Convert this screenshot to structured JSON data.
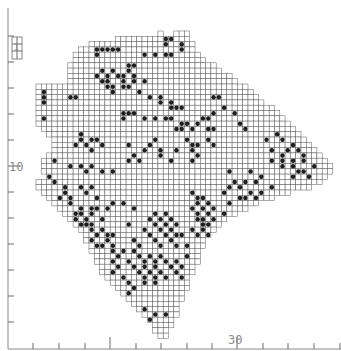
{
  "map": {
    "title": "",
    "axis": {
      "y_label_value": "10",
      "x_label_value": "30",
      "y_ticks_px": [
        36,
        62,
        88,
        114,
        140,
        166,
        192,
        218,
        244,
        270,
        296,
        322
      ],
      "x_ticks_px": [
        33,
        59,
        85,
        110,
        136,
        161,
        187,
        212,
        237,
        263,
        288,
        314,
        340
      ],
      "y_major_tick_px": 166,
      "x_major_tick_px": 237
    },
    "legend_key": "1",
    "grid": {
      "origin_x": 36,
      "origin_y": 31,
      "cell": 5.3,
      "rows": [
        [
          0,
          23,
          23
        ],
        [
          0,
          26,
          28
        ],
        [
          1,
          15,
          28
        ],
        [
          2,
          10,
          29
        ],
        [
          3,
          8,
          29
        ],
        [
          4,
          7,
          30
        ],
        [
          5,
          7,
          31
        ],
        [
          6,
          6,
          33
        ],
        [
          7,
          6,
          34
        ],
        [
          8,
          6,
          36
        ],
        [
          9,
          6,
          37
        ],
        [
          10,
          0,
          39
        ],
        [
          11,
          0,
          40
        ],
        [
          12,
          0,
          41
        ],
        [
          13,
          0,
          42
        ],
        [
          14,
          0,
          44
        ],
        [
          15,
          0,
          45
        ],
        [
          16,
          0,
          46
        ],
        [
          17,
          0,
          47
        ],
        [
          18,
          1,
          48
        ],
        [
          19,
          2,
          49
        ],
        [
          20,
          3,
          50
        ],
        [
          21,
          3,
          51
        ],
        [
          22,
          3,
          52
        ],
        [
          23,
          2,
          53
        ],
        [
          24,
          1,
          54
        ],
        [
          25,
          1,
          55
        ],
        [
          26,
          1,
          55
        ],
        [
          27,
          2,
          54
        ],
        [
          28,
          0,
          53
        ],
        [
          29,
          0,
          51
        ],
        [
          30,
          1,
          47
        ],
        [
          31,
          2,
          44
        ],
        [
          32,
          3,
          41
        ],
        [
          33,
          4,
          39
        ],
        [
          34,
          5,
          37
        ],
        [
          35,
          6,
          35
        ],
        [
          36,
          7,
          34
        ],
        [
          37,
          8,
          33
        ],
        [
          38,
          9,
          32
        ],
        [
          39,
          9,
          31
        ],
        [
          40,
          10,
          31
        ],
        [
          41,
          10,
          30
        ],
        [
          42,
          11,
          30
        ],
        [
          43,
          11,
          30
        ],
        [
          44,
          12,
          29
        ],
        [
          45,
          12,
          29
        ],
        [
          46,
          13,
          28
        ],
        [
          47,
          14,
          28
        ],
        [
          48,
          15,
          28
        ],
        [
          49,
          16,
          27
        ],
        [
          50,
          17,
          27
        ],
        [
          51,
          18,
          26
        ],
        [
          52,
          19,
          26
        ],
        [
          53,
          20,
          26
        ],
        [
          54,
          21,
          25
        ],
        [
          55,
          22,
          25
        ],
        [
          56,
          22,
          24
        ],
        [
          57,
          23,
          24
        ]
      ],
      "filled": [
        [
          1,
          24
        ],
        [
          1,
          25
        ],
        [
          2,
          24
        ],
        [
          2,
          27
        ],
        [
          3,
          27
        ],
        [
          4,
          24
        ],
        [
          4,
          25
        ],
        [
          3,
          11
        ],
        [
          3,
          12
        ],
        [
          3,
          13
        ],
        [
          3,
          14
        ],
        [
          3,
          15
        ],
        [
          4,
          11
        ],
        [
          4,
          20
        ],
        [
          4,
          22
        ],
        [
          6,
          17
        ],
        [
          6,
          18
        ],
        [
          7,
          12
        ],
        [
          7,
          14
        ],
        [
          7,
          17
        ],
        [
          8,
          11
        ],
        [
          8,
          13
        ],
        [
          8,
          15
        ],
        [
          8,
          16
        ],
        [
          8,
          18
        ],
        [
          9,
          12
        ],
        [
          9,
          13
        ],
        [
          9,
          16
        ],
        [
          9,
          18
        ],
        [
          9,
          20
        ],
        [
          10,
          13
        ],
        [
          10,
          14
        ],
        [
          10,
          16
        ],
        [
          10,
          17
        ],
        [
          11,
          14
        ],
        [
          11,
          19
        ],
        [
          11,
          1
        ],
        [
          12,
          1
        ],
        [
          13,
          1
        ],
        [
          12,
          6
        ],
        [
          12,
          7
        ],
        [
          16,
          1
        ],
        [
          12,
          21
        ],
        [
          12,
          23
        ],
        [
          13,
          23
        ],
        [
          13,
          25
        ],
        [
          14,
          25
        ],
        [
          14,
          26
        ],
        [
          14,
          27
        ],
        [
          15,
          16
        ],
        [
          15,
          17
        ],
        [
          15,
          18
        ],
        [
          16,
          16
        ],
        [
          16,
          20
        ],
        [
          16,
          22
        ],
        [
          16,
          24
        ],
        [
          16,
          25
        ],
        [
          17,
          27
        ],
        [
          17,
          28
        ],
        [
          18,
          26
        ],
        [
          18,
          27
        ],
        [
          18,
          29
        ],
        [
          12,
          33
        ],
        [
          12,
          34
        ],
        [
          14,
          35
        ],
        [
          15,
          33
        ],
        [
          15,
          37
        ],
        [
          16,
          31
        ],
        [
          16,
          32
        ],
        [
          17,
          30
        ],
        [
          17,
          38
        ],
        [
          18,
          32
        ],
        [
          18,
          33
        ],
        [
          18,
          39
        ],
        [
          20,
          22
        ],
        [
          20,
          28
        ],
        [
          20,
          32
        ],
        [
          21,
          17
        ],
        [
          21,
          21
        ],
        [
          21,
          29
        ],
        [
          21,
          30
        ],
        [
          21,
          33
        ],
        [
          22,
          20
        ],
        [
          22,
          23
        ],
        [
          22,
          26
        ],
        [
          22,
          29
        ],
        [
          23,
          18
        ],
        [
          23,
          23
        ],
        [
          23,
          30
        ],
        [
          24,
          17
        ],
        [
          24,
          19
        ],
        [
          24,
          25
        ],
        [
          24,
          29
        ],
        [
          19,
          8
        ],
        [
          20,
          8
        ],
        [
          20,
          10
        ],
        [
          20,
          11
        ],
        [
          21,
          7
        ],
        [
          21,
          9
        ],
        [
          21,
          12
        ],
        [
          22,
          10
        ],
        [
          24,
          3
        ],
        [
          25,
          6
        ],
        [
          25,
          8
        ],
        [
          25,
          10
        ],
        [
          26,
          9
        ],
        [
          26,
          12
        ],
        [
          26,
          14
        ],
        [
          19,
          45
        ],
        [
          20,
          43
        ],
        [
          20,
          46
        ],
        [
          21,
          48
        ],
        [
          22,
          44
        ],
        [
          22,
          47
        ],
        [
          22,
          49
        ],
        [
          23,
          46
        ],
        [
          23,
          50
        ],
        [
          24,
          44
        ],
        [
          24,
          46
        ],
        [
          24,
          48
        ],
        [
          24,
          50
        ],
        [
          25,
          46
        ],
        [
          25,
          48
        ],
        [
          25,
          52
        ],
        [
          26,
          49
        ],
        [
          26,
          50
        ],
        [
          27,
          48
        ],
        [
          27,
          51
        ],
        [
          26,
          36
        ],
        [
          26,
          40
        ],
        [
          27,
          42
        ],
        [
          28,
          37
        ],
        [
          28,
          39
        ],
        [
          28,
          41
        ],
        [
          29,
          36
        ],
        [
          29,
          38
        ],
        [
          29,
          44
        ],
        [
          30,
          35
        ],
        [
          30,
          40
        ],
        [
          30,
          42
        ],
        [
          31,
          38
        ],
        [
          31,
          39
        ],
        [
          31,
          41
        ],
        [
          27,
          2
        ],
        [
          28,
          3
        ],
        [
          29,
          5
        ],
        [
          30,
          5
        ],
        [
          31,
          4
        ],
        [
          31,
          6
        ],
        [
          29,
          8
        ],
        [
          30,
          9
        ],
        [
          29,
          10
        ],
        [
          31,
          11
        ],
        [
          32,
          14
        ],
        [
          32,
          16
        ],
        [
          32,
          6
        ],
        [
          33,
          8
        ],
        [
          33,
          10
        ],
        [
          33,
          11
        ],
        [
          33,
          13
        ],
        [
          34,
          7
        ],
        [
          34,
          8
        ],
        [
          34,
          10
        ],
        [
          35,
          7
        ],
        [
          35,
          9
        ],
        [
          35,
          12
        ],
        [
          36,
          8
        ],
        [
          36,
          9
        ],
        [
          36,
          10
        ],
        [
          37,
          10
        ],
        [
          37,
          12
        ],
        [
          38,
          11
        ],
        [
          38,
          13
        ],
        [
          38,
          14
        ],
        [
          39,
          10
        ],
        [
          39,
          13
        ],
        [
          40,
          11
        ],
        [
          40,
          12
        ],
        [
          40,
          14
        ],
        [
          41,
          14
        ],
        [
          41,
          16
        ],
        [
          42,
          15
        ],
        [
          30,
          29
        ],
        [
          31,
          30
        ],
        [
          31,
          31
        ],
        [
          32,
          30
        ],
        [
          32,
          32
        ],
        [
          33,
          29
        ],
        [
          33,
          31
        ],
        [
          33,
          33
        ],
        [
          34,
          30
        ],
        [
          34,
          32
        ],
        [
          35,
          30
        ],
        [
          35,
          31
        ],
        [
          35,
          33
        ],
        [
          36,
          31
        ],
        [
          36,
          32
        ],
        [
          37,
          29
        ],
        [
          37,
          31
        ],
        [
          38,
          30
        ],
        [
          38,
          32
        ],
        [
          34,
          22
        ],
        [
          34,
          24
        ],
        [
          35,
          21
        ],
        [
          35,
          23
        ],
        [
          35,
          25
        ],
        [
          36,
          22
        ],
        [
          36,
          24
        ],
        [
          36,
          26
        ],
        [
          37,
          20
        ],
        [
          37,
          23
        ],
        [
          37,
          25
        ],
        [
          38,
          21
        ],
        [
          38,
          24
        ],
        [
          38,
          26
        ],
        [
          38,
          27
        ],
        [
          39,
          22
        ],
        [
          39,
          25
        ],
        [
          40,
          23
        ],
        [
          40,
          26
        ],
        [
          40,
          28
        ],
        [
          32,
          36
        ],
        [
          34,
          35
        ],
        [
          33,
          18
        ],
        [
          36,
          17
        ],
        [
          39,
          18
        ],
        [
          40,
          19
        ],
        [
          41,
          18
        ],
        [
          42,
          19
        ],
        [
          42,
          21
        ],
        [
          42,
          23
        ],
        [
          43,
          17
        ],
        [
          43,
          20
        ],
        [
          43,
          22
        ],
        [
          43,
          24
        ],
        [
          43,
          26
        ],
        [
          44,
          18
        ],
        [
          44,
          20
        ],
        [
          44,
          22
        ],
        [
          44,
          25
        ],
        [
          45,
          19
        ],
        [
          45,
          21
        ],
        [
          45,
          23
        ],
        [
          45,
          26
        ],
        [
          46,
          20
        ],
        [
          46,
          22
        ],
        [
          46,
          24
        ],
        [
          47,
          20
        ],
        [
          47,
          22
        ],
        [
          43,
          14
        ],
        [
          44,
          15
        ],
        [
          45,
          14
        ],
        [
          46,
          16
        ],
        [
          47,
          17
        ],
        [
          48,
          18
        ],
        [
          49,
          17
        ],
        [
          42,
          28
        ],
        [
          44,
          27
        ],
        [
          46,
          27
        ],
        [
          52,
          20
        ],
        [
          53,
          22
        ],
        [
          53,
          24
        ],
        [
          54,
          21
        ]
      ]
    }
  }
}
